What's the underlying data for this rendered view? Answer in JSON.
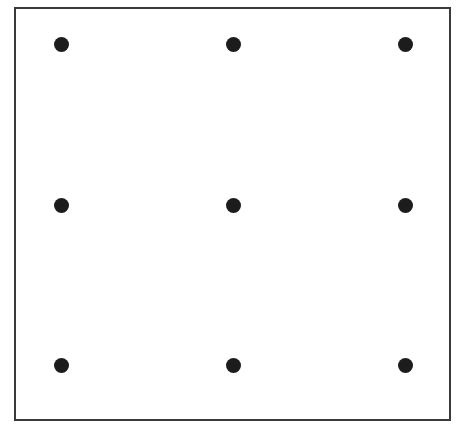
{
  "figure": {
    "type": "diagram",
    "name": "nine-dots-grid",
    "width": 463,
    "height": 430,
    "background_color": "#ffffff",
    "caption": ""
  },
  "frame": {
    "x": 14,
    "y": 7,
    "width": 437,
    "height": 414,
    "border_width": 2,
    "border_color": "#3a3a3a",
    "fill_color": "#ffffff"
  },
  "dot_style": {
    "diameter": 15,
    "color": "#1c1c1c",
    "shape": "circle"
  },
  "grid": {
    "rows": 3,
    "columns": 3,
    "column_centers_x": [
      61,
      233,
      405
    ],
    "row_centers_y": [
      44,
      205,
      365
    ],
    "column_spacing": 172,
    "row_spacing": 160.5,
    "total_dots": 9
  },
  "dots": [
    {
      "id": "dot-r1c1",
      "row": 1,
      "column": 1,
      "cx": 61,
      "cy": 44,
      "r": 7.5
    },
    {
      "id": "dot-r1c2",
      "row": 1,
      "column": 2,
      "cx": 233,
      "cy": 44,
      "r": 7.5
    },
    {
      "id": "dot-r1c3",
      "row": 1,
      "column": 3,
      "cx": 405,
      "cy": 44,
      "r": 7.5
    },
    {
      "id": "dot-r2c1",
      "row": 2,
      "column": 1,
      "cx": 61,
      "cy": 205,
      "r": 7.5
    },
    {
      "id": "dot-r2c2",
      "row": 2,
      "column": 2,
      "cx": 233,
      "cy": 205,
      "r": 7.5
    },
    {
      "id": "dot-r2c3",
      "row": 2,
      "column": 3,
      "cx": 405,
      "cy": 205,
      "r": 7.5
    },
    {
      "id": "dot-r3c1",
      "row": 3,
      "column": 1,
      "cx": 61,
      "cy": 365,
      "r": 7.5
    },
    {
      "id": "dot-r3c2",
      "row": 3,
      "column": 2,
      "cx": 233,
      "cy": 365,
      "r": 7.5
    },
    {
      "id": "dot-r3c3",
      "row": 3,
      "column": 3,
      "cx": 405,
      "cy": 365,
      "r": 7.5
    }
  ]
}
